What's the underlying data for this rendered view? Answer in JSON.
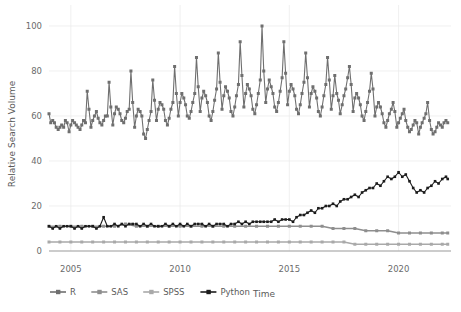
{
  "chart_data": {
    "type": "line",
    "title": "",
    "xlabel": "Time",
    "ylabel": "Relative Search Volume",
    "xlim": [
      2004.0,
      2022.4
    ],
    "ylim": [
      0,
      104
    ],
    "grid": true,
    "legend_position": "bottom",
    "xticks": [
      "2005",
      "2010",
      "2015",
      "2020"
    ],
    "xtick_values": [
      2005,
      2010,
      2015,
      2020
    ],
    "yticks": [
      "0",
      "20",
      "40",
      "60",
      "80",
      "100"
    ],
    "ytick_values": [
      0,
      20,
      40,
      60,
      80,
      100
    ],
    "markers": "square",
    "series": [
      {
        "name": "R",
        "color": "#6f6f6f",
        "x": [
          2004.0,
          2004.08,
          2004.17,
          2004.25,
          2004.33,
          2004.42,
          2004.5,
          2004.58,
          2004.67,
          2004.75,
          2004.83,
          2004.92,
          2005.0,
          2005.08,
          2005.17,
          2005.25,
          2005.33,
          2005.42,
          2005.5,
          2005.58,
          2005.67,
          2005.75,
          2005.83,
          2005.92,
          2006.0,
          2006.08,
          2006.17,
          2006.25,
          2006.33,
          2006.42,
          2006.5,
          2006.58,
          2006.67,
          2006.75,
          2006.83,
          2006.92,
          2007.0,
          2007.08,
          2007.17,
          2007.25,
          2007.33,
          2007.42,
          2007.5,
          2007.58,
          2007.67,
          2007.75,
          2007.83,
          2007.92,
          2008.0,
          2008.08,
          2008.17,
          2008.25,
          2008.33,
          2008.42,
          2008.5,
          2008.58,
          2008.67,
          2008.75,
          2008.83,
          2008.92,
          2009.0,
          2009.08,
          2009.17,
          2009.25,
          2009.33,
          2009.42,
          2009.5,
          2009.58,
          2009.67,
          2009.75,
          2009.83,
          2009.92,
          2010.0,
          2010.08,
          2010.17,
          2010.25,
          2010.33,
          2010.42,
          2010.5,
          2010.58,
          2010.67,
          2010.75,
          2010.83,
          2010.92,
          2011.0,
          2011.08,
          2011.17,
          2011.25,
          2011.33,
          2011.42,
          2011.5,
          2011.58,
          2011.67,
          2011.75,
          2011.83,
          2011.92,
          2012.0,
          2012.08,
          2012.17,
          2012.25,
          2012.33,
          2012.42,
          2012.5,
          2012.58,
          2012.67,
          2012.75,
          2012.83,
          2012.92,
          2013.0,
          2013.08,
          2013.17,
          2013.25,
          2013.33,
          2013.42,
          2013.5,
          2013.58,
          2013.67,
          2013.75,
          2013.83,
          2013.92,
          2014.0,
          2014.08,
          2014.17,
          2014.25,
          2014.33,
          2014.42,
          2014.5,
          2014.58,
          2014.67,
          2014.75,
          2014.83,
          2014.92,
          2015.0,
          2015.08,
          2015.17,
          2015.25,
          2015.33,
          2015.42,
          2015.5,
          2015.58,
          2015.67,
          2015.75,
          2015.83,
          2015.92,
          2016.0,
          2016.08,
          2016.17,
          2016.25,
          2016.33,
          2016.42,
          2016.5,
          2016.58,
          2016.67,
          2016.75,
          2016.83,
          2016.92,
          2017.0,
          2017.08,
          2017.17,
          2017.25,
          2017.33,
          2017.42,
          2017.5,
          2017.58,
          2017.67,
          2017.75,
          2017.83,
          2017.92,
          2018.0,
          2018.08,
          2018.17,
          2018.25,
          2018.33,
          2018.42,
          2018.5,
          2018.58,
          2018.67,
          2018.75,
          2018.83,
          2018.92,
          2019.0,
          2019.08,
          2019.17,
          2019.25,
          2019.33,
          2019.42,
          2019.5,
          2019.58,
          2019.67,
          2019.75,
          2019.83,
          2019.92,
          2020.0,
          2020.08,
          2020.17,
          2020.25,
          2020.33,
          2020.42,
          2020.5,
          2020.58,
          2020.67,
          2020.75,
          2020.83,
          2020.92,
          2021.0,
          2021.08,
          2021.17,
          2021.25,
          2021.33,
          2021.42,
          2021.5,
          2021.58,
          2021.67,
          2021.75,
          2021.83,
          2021.92,
          2022.0,
          2022.08,
          2022.17,
          2022.25
        ],
        "values": [
          61,
          57,
          58,
          57,
          55,
          54,
          55,
          56,
          55,
          58,
          57,
          53,
          56,
          58,
          57,
          56,
          55,
          54,
          56,
          58,
          57,
          71,
          63,
          55,
          58,
          60,
          62,
          59,
          57,
          56,
          58,
          60,
          60,
          75,
          64,
          56,
          61,
          64,
          63,
          61,
          58,
          57,
          59,
          62,
          63,
          80,
          66,
          55,
          60,
          63,
          62,
          60,
          52,
          50,
          54,
          58,
          62,
          76,
          67,
          58,
          63,
          66,
          65,
          63,
          58,
          56,
          59,
          63,
          66,
          82,
          70,
          60,
          66,
          70,
          68,
          65,
          60,
          59,
          62,
          66,
          70,
          86,
          73,
          62,
          68,
          71,
          69,
          66,
          60,
          58,
          62,
          67,
          72,
          88,
          75,
          63,
          69,
          73,
          71,
          68,
          62,
          60,
          64,
          69,
          74,
          93,
          78,
          64,
          70,
          74,
          72,
          69,
          63,
          61,
          65,
          70,
          76,
          100,
          80,
          66,
          72,
          76,
          73,
          70,
          64,
          62,
          66,
          71,
          77,
          93,
          79,
          65,
          71,
          74,
          72,
          69,
          63,
          61,
          65,
          70,
          75,
          88,
          77,
          64,
          70,
          73,
          71,
          68,
          62,
          60,
          64,
          69,
          74,
          86,
          76,
          63,
          69,
          78,
          70,
          67,
          61,
          65,
          69,
          72,
          77,
          82,
          74,
          62,
          68,
          70,
          68,
          65,
          60,
          58,
          62,
          66,
          71,
          79,
          72,
          60,
          64,
          66,
          64,
          61,
          57,
          55,
          58,
          61,
          63,
          66,
          62,
          55,
          57,
          59,
          61,
          63,
          58,
          55,
          53,
          54,
          56,
          58,
          57,
          52,
          55,
          57,
          59,
          61,
          66,
          58,
          54,
          52,
          53,
          55,
          57,
          56,
          55,
          57,
          58,
          57
        ]
      },
      {
        "name": "SAS",
        "color": "#8e8e8e",
        "x": [
          2004.0,
          2004.5,
          2005.0,
          2005.5,
          2006.0,
          2006.5,
          2007.0,
          2007.5,
          2008.0,
          2008.5,
          2009.0,
          2009.5,
          2010.0,
          2010.5,
          2011.0,
          2011.5,
          2012.0,
          2012.5,
          2013.0,
          2013.5,
          2014.0,
          2014.5,
          2015.0,
          2015.5,
          2016.0,
          2016.5,
          2017.0,
          2017.5,
          2018.0,
          2018.5,
          2019.0,
          2019.5,
          2020.0,
          2020.5,
          2021.0,
          2021.5,
          2022.0,
          2022.25
        ],
        "values": [
          11,
          11,
          11,
          11,
          11,
          11,
          11,
          12,
          11,
          11,
          11,
          11,
          11,
          11,
          11,
          11,
          11,
          11,
          11,
          11,
          11,
          11,
          11,
          11,
          11,
          11,
          10,
          10,
          10,
          9,
          9,
          9,
          8,
          8,
          8,
          8,
          8,
          8
        ]
      },
      {
        "name": "SPSS",
        "color": "#a9a9a9",
        "x": [
          2004.0,
          2004.5,
          2005.0,
          2005.5,
          2006.0,
          2006.5,
          2007.0,
          2007.5,
          2008.0,
          2008.5,
          2009.0,
          2009.5,
          2010.0,
          2010.5,
          2011.0,
          2011.5,
          2012.0,
          2012.5,
          2013.0,
          2013.5,
          2014.0,
          2014.5,
          2015.0,
          2015.5,
          2016.0,
          2016.5,
          2017.0,
          2017.5,
          2018.0,
          2018.5,
          2019.0,
          2019.5,
          2020.0,
          2020.5,
          2021.0,
          2021.5,
          2022.0,
          2022.25
        ],
        "values": [
          4,
          4,
          4,
          4,
          4,
          4,
          4,
          4,
          4,
          4,
          4,
          4,
          4,
          4,
          4,
          4,
          4,
          4,
          4,
          4,
          4,
          4,
          4,
          4,
          4,
          4,
          4,
          4,
          3,
          3,
          3,
          3,
          3,
          3,
          3,
          3,
          3,
          3
        ]
      },
      {
        "name": "Python",
        "color": "#1c1c1c",
        "x": [
          2004.0,
          2004.17,
          2004.33,
          2004.5,
          2004.67,
          2004.83,
          2005.0,
          2005.17,
          2005.33,
          2005.5,
          2005.67,
          2005.83,
          2006.0,
          2006.17,
          2006.33,
          2006.5,
          2006.67,
          2006.83,
          2007.0,
          2007.17,
          2007.33,
          2007.5,
          2007.67,
          2007.83,
          2008.0,
          2008.17,
          2008.33,
          2008.5,
          2008.67,
          2008.83,
          2009.0,
          2009.17,
          2009.33,
          2009.5,
          2009.67,
          2009.83,
          2010.0,
          2010.17,
          2010.33,
          2010.5,
          2010.67,
          2010.83,
          2011.0,
          2011.17,
          2011.33,
          2011.5,
          2011.67,
          2011.83,
          2012.0,
          2012.17,
          2012.33,
          2012.5,
          2012.67,
          2012.83,
          2013.0,
          2013.17,
          2013.33,
          2013.5,
          2013.67,
          2013.83,
          2014.0,
          2014.17,
          2014.33,
          2014.5,
          2014.67,
          2014.83,
          2015.0,
          2015.17,
          2015.33,
          2015.5,
          2015.67,
          2015.83,
          2016.0,
          2016.17,
          2016.33,
          2016.5,
          2016.67,
          2016.83,
          2017.0,
          2017.17,
          2017.33,
          2017.5,
          2017.67,
          2017.83,
          2018.0,
          2018.17,
          2018.33,
          2018.5,
          2018.67,
          2018.83,
          2019.0,
          2019.17,
          2019.33,
          2019.5,
          2019.67,
          2019.83,
          2020.0,
          2020.17,
          2020.33,
          2020.5,
          2020.67,
          2020.83,
          2021.0,
          2021.17,
          2021.33,
          2021.5,
          2021.67,
          2021.83,
          2022.0,
          2022.17,
          2022.25
        ],
        "values": [
          11,
          10,
          11,
          10,
          11,
          11,
          11,
          10,
          11,
          10,
          11,
          11,
          11,
          10,
          11,
          15,
          11,
          11,
          12,
          11,
          12,
          11,
          12,
          12,
          12,
          11,
          12,
          11,
          12,
          11,
          11,
          11,
          12,
          11,
          12,
          11,
          12,
          11,
          12,
          11,
          12,
          12,
          12,
          11,
          12,
          11,
          12,
          12,
          12,
          11,
          12,
          12,
          13,
          12,
          13,
          12,
          13,
          13,
          13,
          13,
          13,
          13,
          14,
          13,
          14,
          14,
          14,
          13,
          15,
          16,
          16,
          17,
          18,
          17,
          19,
          19,
          20,
          20,
          21,
          20,
          22,
          23,
          23,
          24,
          25,
          24,
          26,
          27,
          28,
          28,
          30,
          29,
          31,
          33,
          32,
          33,
          35,
          33,
          34,
          31,
          28,
          26,
          27,
          26,
          28,
          29,
          31,
          30,
          32,
          33,
          32
        ]
      }
    ]
  },
  "axes": {
    "ylabel": "Relative Search Volume",
    "xlabel": "Time"
  },
  "legend": {
    "items": [
      {
        "label": "R",
        "color": "#6f6f6f"
      },
      {
        "label": "SAS",
        "color": "#8e8e8e"
      },
      {
        "label": "SPSS",
        "color": "#a9a9a9"
      },
      {
        "label": "Python",
        "color": "#1c1c1c"
      }
    ]
  }
}
